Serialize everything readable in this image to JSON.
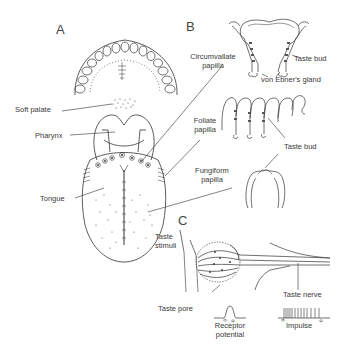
{
  "figure": {
    "panels": {
      "A": "A",
      "B": "B",
      "C": "C"
    },
    "panel_a": {
      "labels": {
        "soft_palate": "Soft palate",
        "pharynx": "Pharynx",
        "tongue": "Tongue"
      }
    },
    "panel_b": {
      "labels": {
        "circumvallate_1": "Circumvallate",
        "circumvallate_2": "papilla",
        "taste_bud_top": "Taste bud",
        "von_ebner": "von Ebner's gland",
        "foliate_1": "Foliate",
        "foliate_2": "papilla",
        "taste_bud_mid": "Taste bud",
        "fungiform_1": "Fungiform",
        "fungiform_2": "papilla"
      }
    },
    "panel_c": {
      "labels": {
        "taste_stimuli_1": "Taste",
        "taste_stimuli_2": "stimuli",
        "taste_pore": "Taste pore",
        "receptor_1": "Receptor",
        "receptor_2": "potential",
        "taste_nerve": "Taste nerve",
        "impulse": "Impulse"
      }
    },
    "colors": {
      "line": "#333333",
      "text": "#3a3a3a",
      "background": "#ffffff"
    }
  }
}
